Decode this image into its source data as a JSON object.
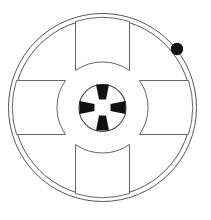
{
  "figure": {
    "background_color": "#ffffff",
    "width": 211,
    "height": 220
  },
  "chart_data": {
    "type": "diagram",
    "xlabel": "",
    "ylabel": "",
    "center": {
      "x": 102.5,
      "y": 107.5
    },
    "elements": [
      {
        "name": "outer-rim-circle",
        "kind": "circle",
        "cx": 102.5,
        "cy": 107.5,
        "r": 94,
        "fill": "none",
        "stroke": "#555555",
        "stroke_width": 1
      },
      {
        "name": "inner-rim-circle",
        "kind": "circle",
        "cx": 102.5,
        "cy": 107.5,
        "r": 89,
        "fill": "none",
        "stroke": "#555555",
        "stroke_width": 1
      },
      {
        "name": "hub-circle",
        "kind": "circle",
        "cx": 102.5,
        "cy": 108,
        "r": 23.5,
        "fill": "#ffffff",
        "stroke": "#444444",
        "stroke_width": 1.1
      },
      {
        "name": "marker-dot",
        "kind": "circle",
        "cx": 177,
        "cy": 49,
        "r": 6.2,
        "fill": "#111111",
        "stroke": "none",
        "position_note": "on inner rim, upper right"
      }
    ],
    "segments": [
      {
        "name": "segment-top",
        "orientation": "top",
        "outer_half_width": 27,
        "outer_radius": 86,
        "inner_radius": 37,
        "concave_edge": "inner",
        "fill": "#ffffff",
        "stroke": "#666666"
      },
      {
        "name": "segment-right",
        "orientation": "right",
        "outer_half_width": 27,
        "outer_radius": 86,
        "inner_radius": 37,
        "concave_edge": "inner",
        "fill": "#ffffff",
        "stroke": "#666666"
      },
      {
        "name": "segment-bottom",
        "orientation": "bottom",
        "outer_half_width": 27,
        "outer_radius": 86,
        "inner_radius": 37,
        "concave_edge": "inner",
        "fill": "#ffffff",
        "stroke": "#666666"
      },
      {
        "name": "segment-left",
        "orientation": "left",
        "outer_half_width": 27,
        "outer_radius": 86,
        "inner_radius": 37,
        "concave_edge": "inner",
        "fill": "#ffffff",
        "stroke": "#666666"
      }
    ],
    "hub_keys": [
      {
        "name": "hub-key-top",
        "orientation": "top",
        "angle_deg": 270,
        "outer_half_width": 6.5,
        "inner_half_width": 3.5,
        "outer_radius": 23,
        "inner_radius": 8,
        "fill": "#111111"
      },
      {
        "name": "hub-key-right",
        "orientation": "right",
        "angle_deg": 0,
        "outer_half_width": 6.5,
        "inner_half_width": 3.5,
        "outer_radius": 23,
        "inner_radius": 8,
        "fill": "#111111"
      },
      {
        "name": "hub-key-bottom",
        "orientation": "bottom",
        "angle_deg": 90,
        "outer_half_width": 6.5,
        "inner_half_width": 3.5,
        "outer_radius": 23,
        "inner_radius": 8,
        "fill": "#111111"
      },
      {
        "name": "hub-key-left",
        "orientation": "left",
        "angle_deg": 180,
        "outer_half_width": 6.5,
        "inner_half_width": 3.5,
        "outer_radius": 23,
        "inner_radius": 8,
        "fill": "#111111"
      }
    ],
    "colors": {
      "line": "#555555",
      "segment_line": "#666666",
      "solid_fill": "#111111",
      "background": "#ffffff"
    },
    "labels": [],
    "legend": [],
    "grid": false
  }
}
